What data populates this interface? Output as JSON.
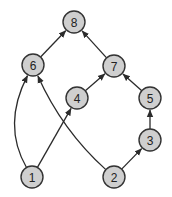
{
  "diagram": {
    "type": "directed-graph",
    "colors": {
      "background": "#ffffff",
      "node_fill": "#cfcfcf",
      "node_stroke": "#333333",
      "edge": "#2b2b2b",
      "label": "#222222"
    },
    "node_radius": 11,
    "nodes": [
      {
        "id": "8",
        "label": "8",
        "x": 74,
        "y": 22
      },
      {
        "id": "6",
        "label": "6",
        "x": 33,
        "y": 65
      },
      {
        "id": "7",
        "label": "7",
        "x": 114,
        "y": 66
      },
      {
        "id": "4",
        "label": "4",
        "x": 77,
        "y": 98
      },
      {
        "id": "5",
        "label": "5",
        "x": 150,
        "y": 98
      },
      {
        "id": "3",
        "label": "3",
        "x": 150,
        "y": 140
      },
      {
        "id": "1",
        "label": "1",
        "x": 32,
        "y": 177
      },
      {
        "id": "2",
        "label": "2",
        "x": 114,
        "y": 177
      }
    ],
    "edges": [
      {
        "from": "6",
        "to": "8",
        "curve": null
      },
      {
        "from": "7",
        "to": "8",
        "curve": null
      },
      {
        "from": "4",
        "to": "7",
        "curve": null
      },
      {
        "from": "5",
        "to": "7",
        "curve": null
      },
      {
        "from": "3",
        "to": "5",
        "curve": null
      },
      {
        "from": "2",
        "to": "3",
        "curve": null
      },
      {
        "from": "1",
        "to": "4",
        "curve": null
      },
      {
        "from": "1",
        "to": "6",
        "curve": {
          "cx": 2,
          "cy": 125
        }
      },
      {
        "from": "2",
        "to": "6",
        "curve": {
          "cx": 62,
          "cy": 130
        }
      }
    ]
  }
}
